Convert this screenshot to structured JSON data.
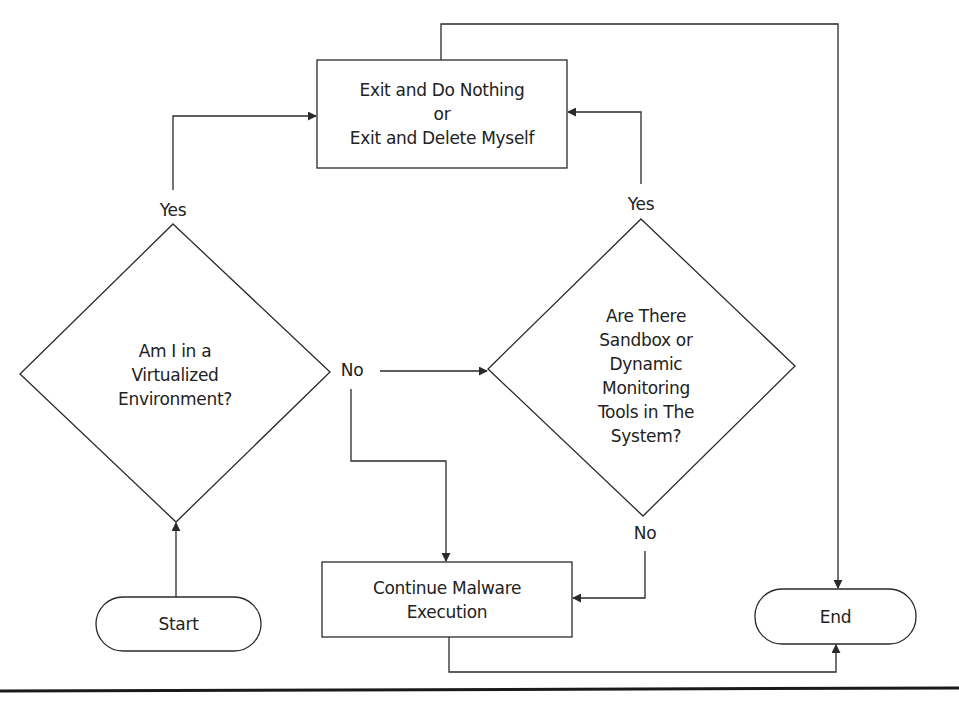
{
  "diagram": {
    "nodes": {
      "start": {
        "label": "Start",
        "shape": "terminator"
      },
      "decision_vm": {
        "label": "Am I in a\nVirtualized\nEnvironment?",
        "shape": "decision"
      },
      "exit_box": {
        "label": "Exit and Do Nothing\nor\nExit and Delete Myself",
        "shape": "process"
      },
      "decision_sandbox": {
        "label": "Are There\nSandbox or\nDynamic\nMonitoring\nTools in The\nSystem?",
        "shape": "decision"
      },
      "continue_box": {
        "label": "Continue Malware\nExecution",
        "shape": "process"
      },
      "end": {
        "label": "End",
        "shape": "terminator"
      }
    },
    "edge_labels": {
      "vm_yes": "Yes",
      "vm_no": "No",
      "sandbox_yes": "Yes",
      "sandbox_no": "No"
    },
    "edges": [
      {
        "from": "start",
        "to": "decision_vm",
        "label": ""
      },
      {
        "from": "decision_vm",
        "to": "exit_box",
        "label": "Yes"
      },
      {
        "from": "decision_vm",
        "to": "decision_sandbox",
        "label": "No"
      },
      {
        "from": "decision_vm",
        "to": "continue_box",
        "label": "No"
      },
      {
        "from": "decision_sandbox",
        "to": "exit_box",
        "label": "Yes"
      },
      {
        "from": "decision_sandbox",
        "to": "continue_box",
        "label": "No"
      },
      {
        "from": "exit_box",
        "to": "end",
        "label": ""
      },
      {
        "from": "continue_box",
        "to": "end",
        "label": ""
      }
    ],
    "colors": {
      "stroke": "#2a2a2a",
      "text": "#222222",
      "background": "#ffffff"
    }
  }
}
